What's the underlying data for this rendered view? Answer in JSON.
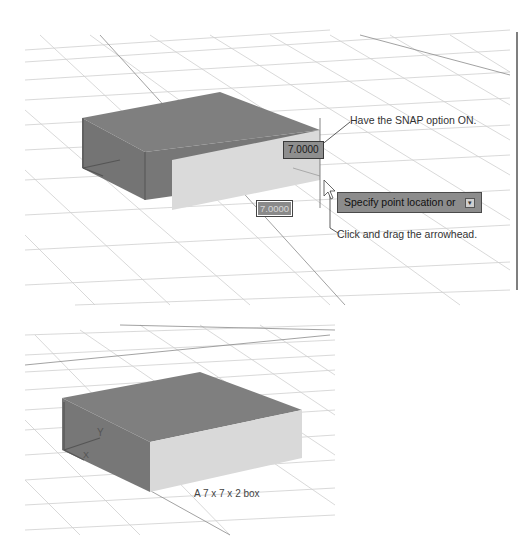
{
  "figure_top": {
    "callouts": {
      "snap": "Have the SNAP option ON.",
      "drag": "Click and drag the arrowhead."
    },
    "dimension_inputs": {
      "height_value": "7.0000",
      "length_value": "7.0000"
    },
    "command_prompt": {
      "text": "Specify point location or",
      "dropdown_icon": "down-arrow-icon"
    },
    "cursor_icon": "arrow-cursor-icon"
  },
  "figure_bottom": {
    "caption": "A 7 x 7 x 2 box",
    "ucs_labels": {
      "x": "X",
      "y": "Y"
    }
  },
  "colors": {
    "box_top": "#7f7f7f",
    "box_front": "#d9d9d9",
    "box_side": "#767676",
    "grid": "#c8c8c8",
    "prompt_bg": "#8c8c8c"
  }
}
